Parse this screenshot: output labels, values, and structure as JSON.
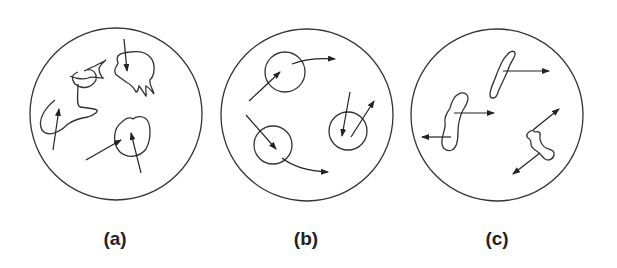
{
  "figure": {
    "panels": [
      {
        "id": "a",
        "label": "(a)",
        "description": "Irregular particles inside a boundary circle, each struck by arrows pointing into them",
        "shape_count": 3,
        "arrow_count": 4
      },
      {
        "id": "b",
        "label": "(b)",
        "description": "Circular particles with arrows passing through / deflected on curved paths",
        "shape_count": 3,
        "arrow_count": 6
      },
      {
        "id": "c",
        "label": "(c)",
        "description": "Elongated irregular particles with straight arrows emanating outward in opposite directions",
        "shape_count": 3,
        "arrow_count": 4
      }
    ],
    "colors": {
      "stroke": "#333333",
      "background": "#ffffff",
      "label": "#222222"
    }
  }
}
